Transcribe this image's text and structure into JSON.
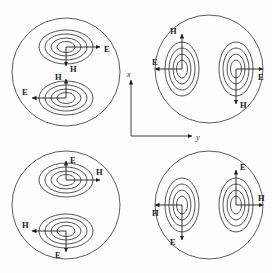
{
  "figure": {
    "title_fragment": "llll'l llLlJl lllll ll llllLll",
    "background_color": "#fefefe",
    "line_color": "#2b2b2b",
    "width": 272,
    "height": 273
  },
  "axes": {
    "vertical_label": "x",
    "horizontal_label": "y",
    "origin": {
      "x": 131,
      "y": 136
    },
    "vertical_tip": {
      "x": 131,
      "y": 77
    },
    "horizontal_tip": {
      "x": 196,
      "y": 136
    }
  },
  "field_labels": {
    "electric": "E",
    "magnetic": "H"
  },
  "panels": [
    {
      "id": "panel-top-left",
      "position": "top-left",
      "boundary": {
        "cx": 66,
        "cy": 72,
        "r": 54
      },
      "lobe_orientation": "horizontal-stacked",
      "contour_count": 4,
      "lobes": [
        {
          "id": "lobe-upper",
          "center": {
            "x": 66,
            "y": 47
          },
          "rx": 26,
          "ry": 16,
          "arrows": [
            {
              "field": "E",
              "direction": "right",
              "label": "E"
            },
            {
              "field": "H",
              "direction": "down",
              "label": "H"
            }
          ]
        },
        {
          "id": "lobe-lower",
          "center": {
            "x": 66,
            "y": 98
          },
          "rx": 26,
          "ry": 16,
          "arrows": [
            {
              "field": "E",
              "direction": "left",
              "label": "E"
            },
            {
              "field": "H",
              "direction": "up",
              "label": "H"
            }
          ]
        }
      ]
    },
    {
      "id": "panel-top-right",
      "position": "top-right",
      "boundary": {
        "cx": 209,
        "cy": 69,
        "r": 54
      },
      "lobe_orientation": "vertical-side-by-side",
      "contour_count": 4,
      "lobes": [
        {
          "id": "lobe-left",
          "center": {
            "x": 182,
            "y": 69
          },
          "rx": 16,
          "ry": 26,
          "arrows": [
            {
              "field": "H",
              "direction": "up",
              "label": "H"
            },
            {
              "field": "E",
              "direction": "left",
              "label": "E"
            }
          ]
        },
        {
          "id": "lobe-right",
          "center": {
            "x": 236,
            "y": 69
          },
          "rx": 16,
          "ry": 26,
          "arrows": [
            {
              "field": "E",
              "direction": "right",
              "label": "E"
            },
            {
              "field": "H",
              "direction": "down",
              "label": "H"
            }
          ]
        }
      ]
    },
    {
      "id": "panel-bottom-left",
      "position": "bottom-left",
      "boundary": {
        "cx": 66,
        "cy": 205,
        "r": 54
      },
      "lobe_orientation": "horizontal-stacked",
      "contour_count": 4,
      "lobes": [
        {
          "id": "lobe-upper",
          "center": {
            "x": 66,
            "y": 180
          },
          "rx": 26,
          "ry": 16,
          "arrows": [
            {
              "field": "E",
              "direction": "up",
              "label": "E"
            },
            {
              "field": "H",
              "direction": "right",
              "label": "H"
            }
          ]
        },
        {
          "id": "lobe-lower",
          "center": {
            "x": 66,
            "y": 231
          },
          "rx": 26,
          "ry": 16,
          "arrows": [
            {
              "field": "H",
              "direction": "left",
              "label": "H"
            },
            {
              "field": "E",
              "direction": "down",
              "label": "E"
            }
          ]
        }
      ]
    },
    {
      "id": "panel-bottom-right",
      "position": "bottom-right",
      "boundary": {
        "cx": 209,
        "cy": 205,
        "r": 54
      },
      "lobe_orientation": "vertical-side-by-side",
      "contour_count": 4,
      "lobes": [
        {
          "id": "lobe-left",
          "center": {
            "x": 182,
            "y": 205
          },
          "rx": 16,
          "ry": 26,
          "arrows": [
            {
              "field": "H",
              "direction": "left",
              "label": "H"
            },
            {
              "field": "E",
              "direction": "down",
              "label": "E"
            }
          ]
        },
        {
          "id": "lobe-right",
          "center": {
            "x": 236,
            "y": 205
          },
          "rx": 16,
          "ry": 26,
          "arrows": [
            {
              "field": "E",
              "direction": "up",
              "label": "E"
            },
            {
              "field": "H",
              "direction": "right",
              "label": "H"
            }
          ]
        }
      ]
    }
  ]
}
